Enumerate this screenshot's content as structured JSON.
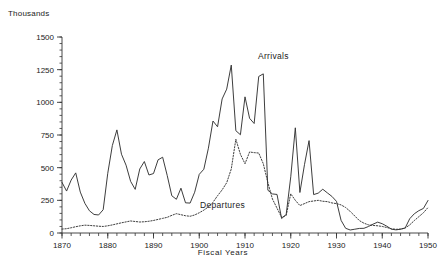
{
  "chart_data": {
    "type": "line",
    "title": "",
    "unit_label": "Thousands",
    "xlabel": "Fiscal Years",
    "ylabel": "",
    "xlim": [
      1870,
      1950
    ],
    "ylim": [
      0,
      1500
    ],
    "x_ticks": [
      1870,
      1880,
      1890,
      1900,
      1910,
      1920,
      1930,
      1940,
      1950
    ],
    "x_minor_tick_step": 2,
    "y_ticks": [
      0,
      250,
      500,
      750,
      1000,
      1250,
      1500
    ],
    "y_minor_tick_step": 50,
    "grid": false,
    "legend_position": "inline-annotations",
    "annotations": [
      {
        "text": "Arrivals",
        "x": 1911,
        "y": 1180
      },
      {
        "text": "Departures",
        "x": 1903,
        "y": 150
      }
    ],
    "series": [
      {
        "name": "Arrivals",
        "style": "solid",
        "color": "#333333",
        "x": [
          1870,
          1871,
          1872,
          1873,
          1874,
          1875,
          1876,
          1877,
          1878,
          1879,
          1880,
          1881,
          1882,
          1883,
          1884,
          1885,
          1886,
          1887,
          1888,
          1889,
          1890,
          1891,
          1892,
          1893,
          1894,
          1895,
          1896,
          1897,
          1898,
          1899,
          1900,
          1901,
          1902,
          1903,
          1904,
          1905,
          1906,
          1907,
          1908,
          1909,
          1910,
          1911,
          1912,
          1913,
          1914,
          1915,
          1916,
          1917,
          1918,
          1919,
          1920,
          1921,
          1922,
          1923,
          1924,
          1925,
          1926,
          1927,
          1928,
          1929,
          1930,
          1931,
          1932,
          1933,
          1934,
          1935,
          1936,
          1937,
          1938,
          1939,
          1940,
          1941,
          1942,
          1943,
          1944,
          1945,
          1946,
          1947,
          1948,
          1949,
          1950
        ],
        "values": [
          387,
          321,
          405,
          460,
          313,
          227,
          170,
          142,
          138,
          178,
          457,
          669,
          789,
          603,
          519,
          395,
          334,
          490,
          547,
          444,
          455,
          560,
          580,
          440,
          285,
          258,
          343,
          231,
          229,
          312,
          449,
          488,
          649,
          857,
          813,
          1026,
          1101,
          1285,
          783,
          752,
          1042,
          878,
          838,
          1198,
          1218,
          327,
          299,
          295,
          111,
          141,
          430,
          805,
          310,
          523,
          707,
          294,
          305,
          335,
          307,
          280,
          242,
          97,
          36,
          23,
          29,
          35,
          36,
          50,
          68,
          83,
          71,
          52,
          29,
          24,
          29,
          38,
          109,
          147,
          171,
          188,
          249
        ]
      },
      {
        "name": "Departures",
        "style": "dotted",
        "color": "#333333",
        "x": [
          1870,
          1871,
          1872,
          1873,
          1874,
          1875,
          1876,
          1877,
          1878,
          1879,
          1880,
          1881,
          1882,
          1883,
          1884,
          1885,
          1886,
          1887,
          1888,
          1889,
          1890,
          1891,
          1892,
          1893,
          1894,
          1895,
          1896,
          1897,
          1898,
          1899,
          1900,
          1901,
          1902,
          1903,
          1904,
          1905,
          1906,
          1907,
          1908,
          1909,
          1910,
          1911,
          1912,
          1913,
          1914,
          1915,
          1916,
          1917,
          1918,
          1919,
          1920,
          1921,
          1922,
          1923,
          1924,
          1925,
          1926,
          1927,
          1928,
          1929,
          1930,
          1931,
          1932,
          1933,
          1934,
          1935,
          1936,
          1937,
          1938,
          1939,
          1940,
          1941,
          1942,
          1943,
          1944,
          1945,
          1946,
          1947,
          1948,
          1949,
          1950
        ],
        "values": [
          30,
          33,
          40,
          48,
          55,
          60,
          58,
          55,
          52,
          50,
          55,
          62,
          70,
          78,
          85,
          92,
          88,
          84,
          86,
          90,
          96,
          104,
          112,
          120,
          135,
          148,
          140,
          132,
          128,
          138,
          155,
          175,
          200,
          235,
          285,
          330,
          385,
          490,
          718,
          602,
          530,
          620,
          615,
          612,
          530,
          385,
          260,
          190,
          120,
          135,
          300,
          250,
          210,
          225,
          240,
          245,
          250,
          243,
          240,
          230,
          225,
          215,
          195,
          165,
          130,
          95,
          75,
          62,
          58,
          55,
          50,
          42,
          33,
          28,
          30,
          38,
          62,
          95,
          125,
          155,
          195
        ]
      }
    ]
  }
}
